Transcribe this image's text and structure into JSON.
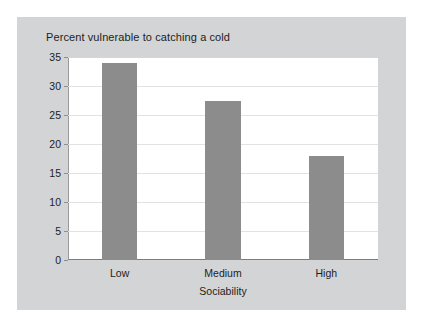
{
  "chart_data": {
    "type": "bar",
    "title": "Percent vulnerable to catching a cold",
    "xlabel": "Sociability",
    "ylabel": "",
    "categories": [
      "Low",
      "Medium",
      "High"
    ],
    "values": [
      34,
      27.5,
      18
    ],
    "ylim": [
      0,
      35
    ],
    "yticks": [
      0,
      5,
      10,
      15,
      20,
      25,
      30,
      35
    ],
    "ytick_labels": [
      "0",
      "5",
      "10",
      "15",
      "20",
      "25",
      "30",
      "35"
    ],
    "grid": true,
    "legend": false,
    "bar_color": "#8c8c8c",
    "plot_background": "#ffffff",
    "panel_background": "#d3d4d5",
    "gridline_color": "#e2e2e2",
    "text_color": "#1d1d1d"
  }
}
